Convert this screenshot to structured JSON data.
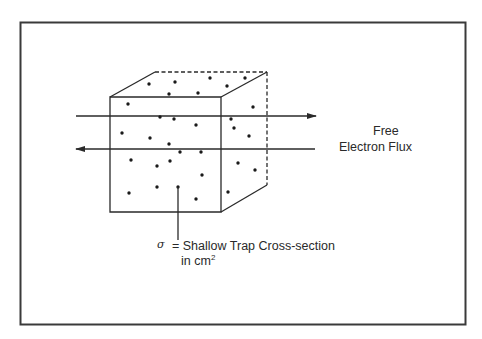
{
  "figure": {
    "colors": {
      "line": "#2a2a2a",
      "background": "#ffffff"
    },
    "cube": {
      "front": [
        [
          110,
          97
        ],
        [
          221,
          97
        ],
        [
          221,
          212
        ],
        [
          110,
          212
        ]
      ],
      "back_top_left": [
        155,
        72
      ],
      "back_top_right": [
        267,
        72
      ],
      "back_bottom_right": [
        267,
        185
      ]
    },
    "arrows": [
      {
        "name": "flux-arrow-right",
        "y": 116,
        "x1": 76,
        "x2": 316,
        "direction": "right"
      },
      {
        "name": "flux-arrow-left",
        "y": 149,
        "x1": 76,
        "x2": 315,
        "direction": "left"
      }
    ],
    "traps": [
      [
        149,
        84
      ],
      [
        175,
        82
      ],
      [
        210,
        78
      ],
      [
        227,
        86
      ],
      [
        245,
        78
      ],
      [
        169,
        94
      ],
      [
        198,
        93
      ],
      [
        128,
        104
      ],
      [
        160,
        117
      ],
      [
        174,
        119
      ],
      [
        196,
        125
      ],
      [
        122,
        133
      ],
      [
        150,
        138
      ],
      [
        169,
        144
      ],
      [
        180,
        152
      ],
      [
        201,
        152
      ],
      [
        131,
        160
      ],
      [
        157,
        166
      ],
      [
        170,
        161
      ],
      [
        202,
        175
      ],
      [
        157,
        187
      ],
      [
        178,
        187
      ],
      [
        129,
        193
      ],
      [
        196,
        199
      ],
      [
        253,
        107
      ],
      [
        231,
        119
      ],
      [
        234,
        128
      ],
      [
        249,
        136
      ],
      [
        238,
        163
      ],
      [
        255,
        170
      ],
      [
        228,
        192
      ]
    ],
    "pointer": {
      "x": 178,
      "y1": 187,
      "y2": 240
    }
  },
  "labels": {
    "flux_line1": "Free",
    "flux_line2": "Electron Flux",
    "sigma_symbol": "σ",
    "sigma_def_line1": "= Shallow Trap Cross-section",
    "sigma_def_line2_prefix": "in cm",
    "sigma_def_line2_sup": "2"
  }
}
